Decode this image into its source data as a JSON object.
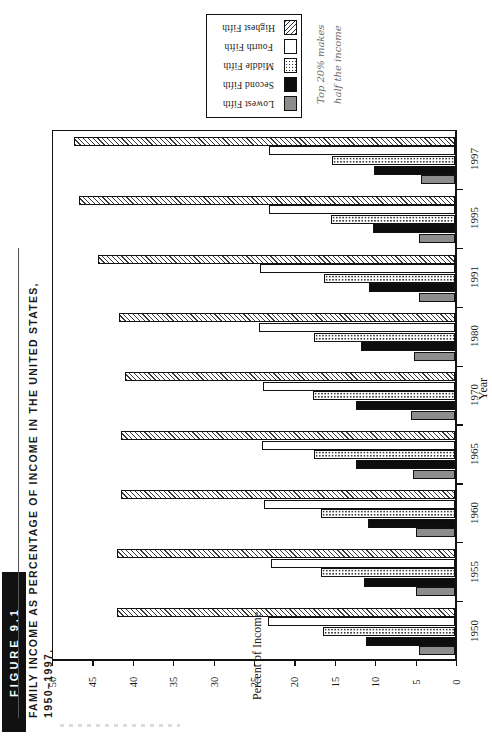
{
  "figure": {
    "badge": "FIGURE 9.1",
    "title_line1": "Family Income as Percentage of Income in the United States,",
    "title_line2": "1950–1997."
  },
  "annotation": {
    "line1": "Top 20% makes",
    "line2": "half the income"
  },
  "legend": {
    "items": [
      {
        "label": "Lowest Fifth",
        "swatch": "gray-solid-swatch",
        "color": "#8d8d8d"
      },
      {
        "label": "Second Fifth",
        "swatch": "black-solid-swatch",
        "color": "#0d0d0d"
      },
      {
        "label": "Middle Fifth",
        "swatch": "dotted-swatch",
        "color": "#ffffff"
      },
      {
        "label": "Fourth Fifth",
        "swatch": "white-solid-swatch",
        "color": "#ffffff"
      },
      {
        "label": "Highest Fifth",
        "swatch": "hatched-swatch",
        "color": "#ffffff"
      }
    ]
  },
  "chart_data": {
    "type": "bar",
    "orientation": "horizontal",
    "title": "Family Income as Percentage of Income in the United States, 1950–1997.",
    "xlabel": "Percent of Income",
    "ylabel": "Year",
    "xlim": [
      0,
      50
    ],
    "xticks": [
      50,
      45,
      40,
      35,
      30,
      25,
      20,
      15,
      10,
      5,
      0
    ],
    "x_axis_direction": "reversed",
    "grid": false,
    "legend_position": "top-outside",
    "categories": [
      "1997",
      "1995",
      "1991",
      "1980",
      "1970",
      "1965",
      "1960",
      "1955",
      "1950"
    ],
    "series": [
      {
        "name": "Lowest Fifth",
        "values": [
          4.2,
          4.4,
          4.5,
          5.1,
          5.4,
          5.2,
          4.8,
          4.8,
          4.5
        ]
      },
      {
        "name": "Second Fifth",
        "values": [
          10.0,
          10.1,
          10.7,
          11.6,
          12.2,
          12.2,
          10.8,
          11.3,
          11.0
        ]
      },
      {
        "name": "Middle Fifth",
        "values": [
          15.2,
          15.4,
          16.2,
          17.5,
          17.6,
          17.5,
          16.6,
          16.6,
          16.4
        ]
      },
      {
        "name": "Fourth Fifth",
        "values": [
          23.0,
          23.0,
          24.1,
          24.3,
          23.8,
          23.9,
          23.6,
          22.8,
          23.1
        ]
      },
      {
        "name": "Highest Fifth",
        "values": [
          47.2,
          46.5,
          44.2,
          41.6,
          40.9,
          41.3,
          41.3,
          41.8,
          41.8
        ]
      }
    ]
  },
  "axes": {
    "value_axis_title": "Percent of Income",
    "category_axis_title": "Year"
  }
}
